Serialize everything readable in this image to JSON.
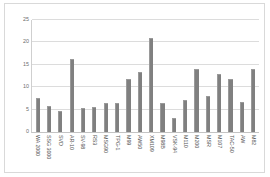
{
  "chart_data": {
    "type": "bar",
    "title": "",
    "subtitle": "",
    "xlabel": "",
    "ylabel": "",
    "ylim": [
      0,
      25
    ],
    "yticks": [
      0,
      5,
      10,
      15,
      20,
      25
    ],
    "grid": true,
    "legend": false,
    "legend_position": "none",
    "orientation": "vertical",
    "bar_color": "#808080",
    "categories": [
      "WA 2000",
      "SSG 3000",
      "SVD",
      "AR-10",
      "SV-98",
      "RS3",
      "MSG90",
      "TPG-1",
      "M99",
      "AW50",
      "XM109",
      "M98B",
      "VSK-94",
      "M110",
      "M200",
      "MSR",
      "M107",
      "TAC-50",
      "AW",
      "M82"
    ],
    "values": [
      7.5,
      5.8,
      4.6,
      16.3,
      5.3,
      5.5,
      6.5,
      6.4,
      11.9,
      13.5,
      21.0,
      6.4,
      3.2,
      7.1,
      14.1,
      8.0,
      13.0,
      11.9,
      6.8,
      14.1
    ]
  },
  "colors": {
    "bar": "#808080",
    "gridline": "#dcdcdc",
    "axis": "#c4c4c4",
    "tick_text": "#6e6e6e",
    "frame": "#d9d9d9",
    "background": "#ffffff"
  }
}
